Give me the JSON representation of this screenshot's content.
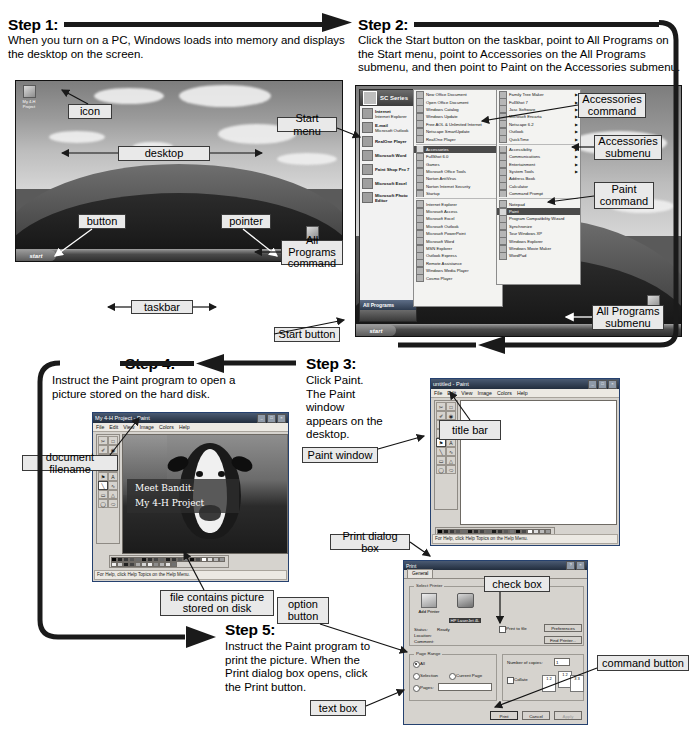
{
  "steps": {
    "step1": {
      "title": "Step 1:",
      "body": "When you turn on a PC, Windows loads into memory and displays the desktop on the screen."
    },
    "step2": {
      "title": "Step 2:",
      "body": "Click the Start button on the taskbar, point to All Programs on the Start menu, point to Accessories on the All Programs submenu, and then point to Paint on the Accessories submenu."
    },
    "step3": {
      "title": "Step 3:",
      "body": "Click Paint. The Paint window appears on the desktop."
    },
    "step4": {
      "title": "Step 4:",
      "body": "Instruct the Paint program to open a picture stored on the hard disk."
    },
    "step5": {
      "title": "Step 5:",
      "body": "Instruct the Paint program to print the picture. When the Print dialog box opens, click the Print button."
    }
  },
  "callouts": {
    "icon": "icon",
    "desktop": "desktop",
    "start_menu": "Start menu",
    "button": "button",
    "pointer": "pointer",
    "taskbar": "taskbar",
    "all_programs_command": "All Programs\ncommand",
    "start_button": "Start button",
    "accessories_command": "Accessories\ncommand",
    "accessories_submenu": "Accessories\nsubmenu",
    "paint_command": "Paint\ncommand",
    "all_programs_submenu": "All Programs\nsubmenu",
    "title_bar": "title bar",
    "paint_window": "Paint window",
    "document_filename": "document filename",
    "file_contains_picture": "file contains picture\nstored on disk",
    "print_dialog_box": "Print dialog box",
    "check_box": "check box",
    "option_button": "option button",
    "command_button": "command button",
    "text_box": "text box"
  },
  "desktop": {
    "start_label": "start",
    "tray_time": "12:33 PM",
    "icons": [
      {
        "label": "My 4-H\nProject"
      },
      {
        "label": "Recycle Bin"
      }
    ]
  },
  "start_menu": {
    "user_name": "SC Series",
    "all_programs": "All Programs",
    "start_label": "start",
    "pinned": [
      {
        "title": "Internet",
        "sub": "Internet Explorer"
      },
      {
        "title": "E-mail",
        "sub": "Microsoft Outlook"
      },
      {
        "title": "RealOne Player",
        "sub": ""
      },
      {
        "title": "Microsoft Word",
        "sub": ""
      },
      {
        "title": "Paint Shop Pro 7",
        "sub": ""
      },
      {
        "title": "Microsoft Excel",
        "sub": ""
      },
      {
        "title": "Microsoft Photo Editor",
        "sub": ""
      }
    ],
    "all_programs_items": [
      {
        "label": "New Office Document",
        "arrow": false
      },
      {
        "label": "Open Office Document",
        "arrow": false
      },
      {
        "label": "Windows Catalog",
        "arrow": false
      },
      {
        "label": "Windows Update",
        "arrow": false
      },
      {
        "label": "Free AOL & Unlimited Internet",
        "arrow": false
      },
      {
        "label": "Netscape SmartUpdate",
        "arrow": false
      },
      {
        "label": "RealOne Player",
        "arrow": false
      },
      {
        "label": "Accessories",
        "arrow": true,
        "selected": true
      },
      {
        "label": "FullShot 6.0",
        "arrow": true
      },
      {
        "label": "Games",
        "arrow": true
      },
      {
        "label": "Microsoft Office Tools",
        "arrow": true
      },
      {
        "label": "Norton AntiVirus",
        "arrow": true
      },
      {
        "label": "Norton Internet Security",
        "arrow": true
      },
      {
        "label": "Startup",
        "arrow": true
      },
      {
        "label": "Internet Explorer",
        "arrow": false
      },
      {
        "label": "Microsoft Access",
        "arrow": false
      },
      {
        "label": "Microsoft Excel",
        "arrow": false
      },
      {
        "label": "Microsoft Outlook",
        "arrow": false
      },
      {
        "label": "Microsoft PowerPoint",
        "arrow": false
      },
      {
        "label": "Microsoft Word",
        "arrow": false
      },
      {
        "label": "MSN Explorer",
        "arrow": false
      },
      {
        "label": "Outlook Express",
        "arrow": false
      },
      {
        "label": "Remote Assistance",
        "arrow": false
      },
      {
        "label": "Windows Media Player",
        "arrow": false
      },
      {
        "label": "Cosmo Player",
        "arrow": false
      }
    ],
    "accessories_items": [
      {
        "label": "Family Tree Maker",
        "arrow": true
      },
      {
        "label": "FullShot 7",
        "arrow": true
      },
      {
        "label": "Jasc Software",
        "arrow": true
      },
      {
        "label": "Microsoft Encarta",
        "arrow": true
      },
      {
        "label": "Netscape 6.2",
        "arrow": true
      },
      {
        "label": "Outlook",
        "arrow": true
      },
      {
        "label": "QuickTime",
        "arrow": true
      },
      {
        "label": "Accessibility",
        "arrow": true
      },
      {
        "label": "Communications",
        "arrow": true
      },
      {
        "label": "Entertainment",
        "arrow": true
      },
      {
        "label": "System Tools",
        "arrow": true
      },
      {
        "label": "Address Book",
        "arrow": false
      },
      {
        "label": "Calculator",
        "arrow": false
      },
      {
        "label": "Command Prompt",
        "arrow": false
      },
      {
        "label": "Notepad",
        "arrow": false
      },
      {
        "label": "Paint",
        "arrow": false,
        "selected": true
      },
      {
        "label": "Program Compatibility Wizard",
        "arrow": false
      },
      {
        "label": "Synchronize",
        "arrow": false
      },
      {
        "label": "Tour Windows XP",
        "arrow": false
      },
      {
        "label": "Windows Explorer",
        "arrow": false
      },
      {
        "label": "Windows Movie Maker",
        "arrow": false
      },
      {
        "label": "WordPad",
        "arrow": false
      }
    ]
  },
  "paint_untitled": {
    "title": "untitled - Paint",
    "menu": [
      "File",
      "Edit",
      "View",
      "Image",
      "Colors",
      "Help"
    ],
    "status": "For Help, click Help Topics on the Help Menu."
  },
  "paint_project": {
    "title": "My 4-H Project  - Paint",
    "menu": [
      "File",
      "Edit",
      "View",
      "Image",
      "Colors",
      "Help"
    ],
    "status": "For Help, click Help Topics on the Help Menu.",
    "picture_text_line1": "Meet Bandit.",
    "picture_text_line2": "My 4-H Project"
  },
  "print_dialog": {
    "title": "Print",
    "tab": "General",
    "select_printer_legend": "Select Printer",
    "add_printer": "Add Printer",
    "printer_name": "HP LaserJet 4L",
    "status_label": "Status:",
    "status_value": "Ready",
    "location_label": "Location:",
    "comment_label": "Comment:",
    "print_to_file": "Print to file",
    "preferences": "Preferences",
    "find_printer": "Find Printer...",
    "page_range_legend": "Page Range",
    "opt_all": "All",
    "opt_selection": "Selection",
    "opt_current_page": "Current Page",
    "opt_pages": "Pages:",
    "copies_label": "Number of copies:",
    "copies_value": "1",
    "collate": "Collate",
    "print_button": "Print",
    "cancel_button": "Cancel",
    "apply_button": "Apply"
  }
}
